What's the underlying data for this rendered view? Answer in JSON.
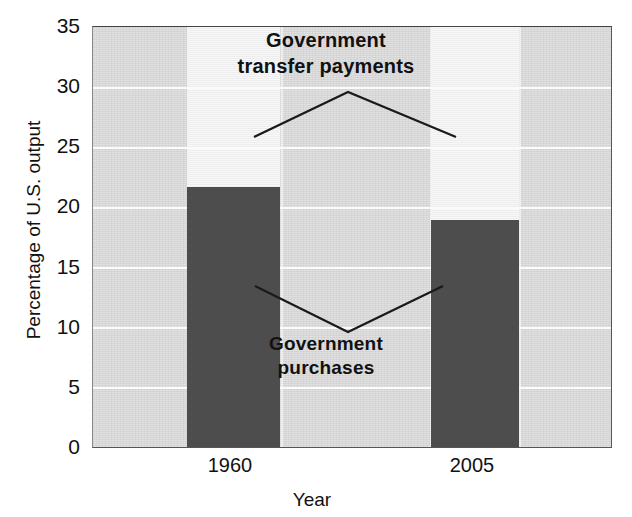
{
  "chart_data": {
    "type": "bar",
    "title": "",
    "xlabel": "Year",
    "ylabel": "Percentage of U.S. output",
    "categories": [
      "1960",
      "2005"
    ],
    "ylim": [
      0,
      35
    ],
    "yticks": [
      0,
      5,
      10,
      15,
      20,
      25,
      30,
      35
    ],
    "ytick_labels": [
      "0",
      "5",
      "10",
      "15",
      "20",
      "25",
      "30",
      "35"
    ],
    "grid": "horizontal",
    "legend_position": "in-plot-annotations",
    "series": [
      {
        "name": "Government purchases",
        "color": "#4d4d4d",
        "values": [
          21.7,
          18.9
        ]
      },
      {
        "name": "Government transfer payments",
        "color": "#f1f1f1",
        "values": [
          35.0,
          35.0
        ]
      }
    ],
    "annotations": [
      {
        "name": "transfer-payments-callout",
        "line1": "Government",
        "line2": "transfer payments",
        "points_to": [
          "1960 light bar",
          "2005 light bar"
        ]
      },
      {
        "name": "purchases-callout",
        "line1": "Government",
        "line2": "purchases",
        "points_to": [
          "1960 dark bar",
          "2005 dark bar"
        ]
      }
    ]
  },
  "axes": {
    "y_title": "Percentage of U.S. output",
    "x_title": "Year",
    "y_ticks": [
      "35",
      "30",
      "25",
      "20",
      "15",
      "10",
      "5",
      "0"
    ],
    "x_ticks": [
      "1960",
      "2005"
    ]
  },
  "annotations": {
    "transfer": {
      "line1": "Government",
      "line2": "transfer payments"
    },
    "purchases": {
      "line1": "Government",
      "line2": "purchases"
    }
  },
  "colors": {
    "plot_background": "#dcdcdc",
    "gridline": "#fbfbfb",
    "purchases_bar": "#4d4d4d",
    "transfer_bar": "#f1f1f1",
    "text": "#111111",
    "frame": "#555555"
  }
}
